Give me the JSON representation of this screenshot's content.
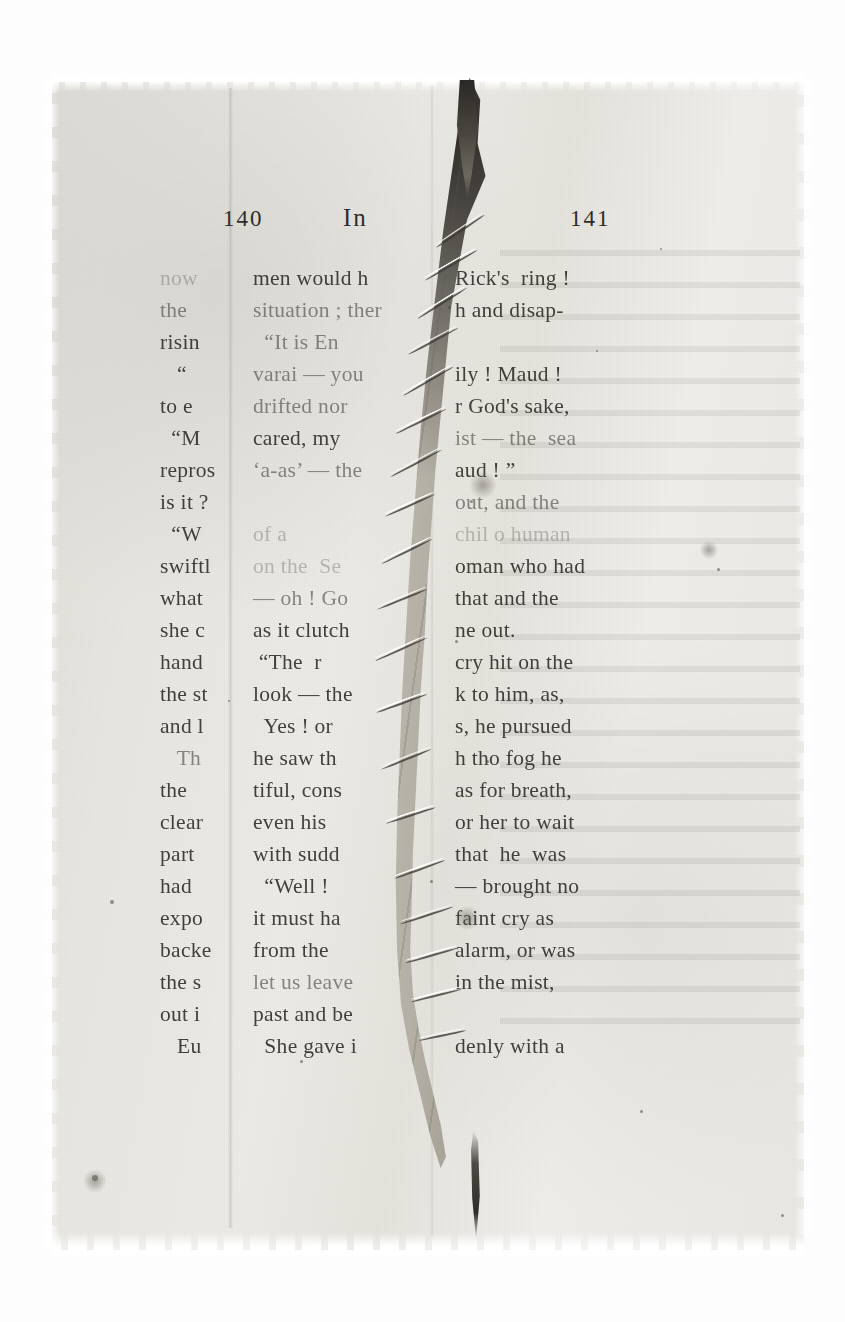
{
  "document": {
    "type": "damaged-printed-book-leaf",
    "description": "Photograph of a torn and thread-repaired printed book page",
    "paper_color": "#e7e5e0",
    "ink_color": "#35322e",
    "tear_color": "#b0aba1"
  },
  "running_head": {
    "page_number_left": "140",
    "title": "In",
    "page_number_right": "141"
  },
  "columns": {
    "left_fragments": [
      {
        "text": "now",
        "fade": "f3"
      },
      {
        "text": "the",
        "fade": "f2"
      },
      {
        "text": "risin",
        "fade": "f1"
      },
      {
        "text": "   “",
        "fade": "f1"
      },
      {
        "text": "to e",
        "fade": "f1"
      },
      {
        "text": "  “M",
        "fade": "f1"
      },
      {
        "text": "repros",
        "fade": "f1"
      },
      {
        "text": "is it ?",
        "fade": "f1"
      },
      {
        "text": "  “W",
        "fade": "f1"
      },
      {
        "text": "swiftl",
        "fade": "f1"
      },
      {
        "text": "what",
        "fade": "f1"
      },
      {
        "text": "she c",
        "fade": "f1"
      },
      {
        "text": "hand",
        "fade": "f1"
      },
      {
        "text": "the st",
        "fade": "f1"
      },
      {
        "text": "and l",
        "fade": "f1"
      },
      {
        "text": "   Th",
        "fade": "f2"
      },
      {
        "text": "the",
        "fade": "f1"
      },
      {
        "text": "clear",
        "fade": "f1"
      },
      {
        "text": "part",
        "fade": "f1"
      },
      {
        "text": "had",
        "fade": "f1"
      },
      {
        "text": "expo",
        "fade": "f1"
      },
      {
        "text": "backe",
        "fade": "f1"
      },
      {
        "text": "the s",
        "fade": "f1"
      },
      {
        "text": "out i",
        "fade": "f1"
      },
      {
        "text": "   Eu",
        "fade": "f1"
      }
    ],
    "middle_fragments": [
      {
        "text": "men would h",
        "fade": "f1"
      },
      {
        "text": "situation ; ther",
        "fade": "f2"
      },
      {
        "text": "  “It is En",
        "fade": "f2"
      },
      {
        "text": "varai — you",
        "fade": "f2"
      },
      {
        "text": "drifted nor",
        "fade": "f2"
      },
      {
        "text": "cared, my",
        "fade": "f1"
      },
      {
        "text": "‘a-as’ — the",
        "fade": "f2"
      },
      {
        "text": "",
        "fade": "f4"
      },
      {
        "text": "of a",
        "fade": "f3"
      },
      {
        "text": "on the  Se",
        "fade": "f3"
      },
      {
        "text": "— oh ! Go",
        "fade": "f2"
      },
      {
        "text": "as it clutch",
        "fade": "f1"
      },
      {
        "text": " “The  r",
        "fade": "f1"
      },
      {
        "text": "look — the",
        "fade": "f1"
      },
      {
        "text": "  Yes ! or",
        "fade": "f1"
      },
      {
        "text": "he saw th",
        "fade": "f1"
      },
      {
        "text": "tiful, cons",
        "fade": "f1"
      },
      {
        "text": "even his",
        "fade": "f1"
      },
      {
        "text": "with sudd",
        "fade": "f1"
      },
      {
        "text": "  “Well !",
        "fade": "f1"
      },
      {
        "text": "it must ha",
        "fade": "f1"
      },
      {
        "text": "from the",
        "fade": "f1"
      },
      {
        "text": "let us leave",
        "fade": "f2"
      },
      {
        "text": "past and be",
        "fade": "f1"
      },
      {
        "text": "  She gave i",
        "fade": "f1"
      }
    ],
    "right_fragments": [
      {
        "text": "Rick's  ring !",
        "fade": "f1"
      },
      {
        "text": "h and disap-",
        "fade": "f1"
      },
      {
        "text": "",
        "fade": "f4"
      },
      {
        "text": "ily ! Maud !",
        "fade": "f1"
      },
      {
        "text": "r God's sake,",
        "fade": "f1"
      },
      {
        "text": "ist — the  sea",
        "fade": "f2"
      },
      {
        "text": "aud ! ”",
        "fade": "f1"
      },
      {
        "text": "out, and the",
        "fade": "f2"
      },
      {
        "text": "chil o human",
        "fade": "f3"
      },
      {
        "text": "oman who had",
        "fade": "f1"
      },
      {
        "text": "that and the",
        "fade": "f1"
      },
      {
        "text": "ne out.",
        "fade": "f1"
      },
      {
        "text": "cry hit on the",
        "fade": "f1"
      },
      {
        "text": "k to him, as,",
        "fade": "f1"
      },
      {
        "text": "s, he pursued",
        "fade": "f1"
      },
      {
        "text": "h tho fog he",
        "fade": "f1"
      },
      {
        "text": "as for breath,",
        "fade": "f1"
      },
      {
        "text": "or her to wait",
        "fade": "f1"
      },
      {
        "text": "that  he  was",
        "fade": "f1"
      },
      {
        "text": "— brought no",
        "fade": "f1"
      },
      {
        "text": "faint cry as",
        "fade": "f1"
      },
      {
        "text": "alarm, or was",
        "fade": "f1"
      },
      {
        "text": "in the mist,",
        "fade": "f1"
      },
      {
        "text": "",
        "fade": "f4"
      },
      {
        "text": "denly with a",
        "fade": "f1"
      }
    ]
  },
  "damage": {
    "tear_label": "vertical-tear",
    "repair_label": "thread-stitching",
    "stitch_count": 14
  }
}
